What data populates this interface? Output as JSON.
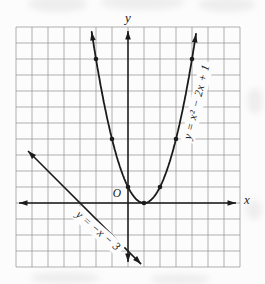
{
  "figure": {
    "bg_color": "#fcfcfc",
    "ink_color": "#1b1b1b",
    "grid_color": "#8f8f8f",
    "halo_color": "#fcfcfc"
  },
  "labels": {
    "x_axis": "x",
    "y_axis": "y",
    "origin": "O",
    "parabola": "y = x² − 2x + 1",
    "line": "y = −x − 3"
  },
  "chart_data": {
    "type": "line",
    "title": "",
    "xlabel": "x",
    "ylabel": "y",
    "xlim": [
      -7,
      7
    ],
    "ylim": [
      -4,
      11
    ],
    "grid": true,
    "grid_unit": 1,
    "axes_arrows": "both-ends",
    "series": [
      {
        "name": "y = x² − 2x + 1",
        "equation": "y = x^2 - 2x + 1",
        "kind": "parabola",
        "coefficients": {
          "a": 1,
          "b": -2,
          "c": 1
        },
        "vertex": [
          1,
          0
        ],
        "domain_drawn": [
          -2.27,
          4.27
        ],
        "arrow_ends": true,
        "marked_points": [
          [
            -2,
            9
          ],
          [
            -1,
            4
          ],
          [
            0,
            1
          ],
          [
            1,
            0
          ],
          [
            2,
            1
          ],
          [
            3,
            4
          ],
          [
            4,
            9
          ]
        ]
      },
      {
        "name": "y = −x − 3",
        "equation": "y = -x - 3",
        "kind": "linear",
        "slope": -1,
        "intercept": -3,
        "domain_drawn": [
          -6.25,
          0.82
        ],
        "arrow_ends": true,
        "x_intercept": [
          -3,
          0
        ],
        "y_intercept": [
          0,
          -3
        ],
        "marked_points": []
      }
    ]
  }
}
